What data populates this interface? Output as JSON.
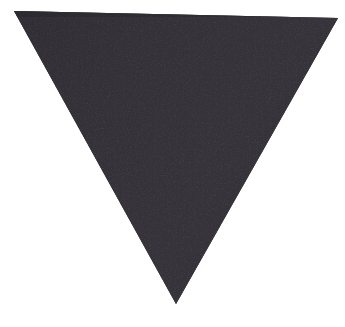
{
  "canvas": {
    "width": 345,
    "height": 327,
    "background_color": "#ffffff",
    "description": "Photograph of a single downward-pointing dark charcoal triangle centered on a plain white background"
  },
  "figure": {
    "name": "downward-triangle",
    "shape_type": "triangle",
    "orientation": "point-down",
    "fill_color": "#343239",
    "fill_color_shadow": "#2c2a30",
    "fill_color_highlight": "#3b3940",
    "edge_softness_px": 1.2,
    "texture": "fine woven fabric / paper grain noise",
    "vertices": [
      {
        "label": "top-left",
        "x": 14,
        "y": 11
      },
      {
        "label": "top-right",
        "x": 338,
        "y": 18
      },
      {
        "label": "bottom-apex",
        "x": 176,
        "y": 304
      }
    ],
    "polygon_points": "14,11 338,18 176,304",
    "edges": [
      {
        "label": "top-edge",
        "from": "top-left",
        "to": "top-right"
      },
      {
        "label": "right-edge",
        "from": "top-right",
        "to": "bottom-apex"
      },
      {
        "label": "left-edge",
        "from": "bottom-apex",
        "to": "top-left"
      }
    ]
  }
}
